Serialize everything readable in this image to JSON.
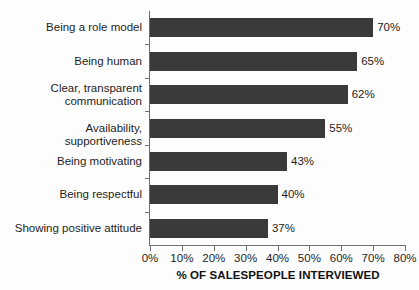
{
  "chart_data": {
    "type": "bar",
    "orientation": "horizontal",
    "title": "",
    "subtitle": "",
    "xlabel": "% OF SALESPEOPLE INTERVIEWED",
    "ylabel": "",
    "categories": [
      "Being a role model",
      "Being human",
      "Clear, transparent\ncommunication",
      "Availability, supportiveness",
      "Being motivating",
      "Being respectful",
      "Showing positive attitude"
    ],
    "values": [
      70,
      65,
      62,
      55,
      43,
      40,
      37
    ],
    "value_labels": [
      "70%",
      "65%",
      "62%",
      "55%",
      "43%",
      "40%",
      "37%"
    ],
    "xlim": [
      0,
      80
    ],
    "xticks": [
      0,
      10,
      20,
      30,
      40,
      50,
      60,
      70,
      80
    ],
    "xtick_labels": [
      "0%",
      "10%",
      "20%",
      "30%",
      "40%",
      "50%",
      "60%",
      "70%",
      "80%"
    ],
    "grid": false,
    "legend": false,
    "legend_position": "none",
    "bar_color": "#3a3a3a",
    "axis_color": "#6e6e6e",
    "text_color": "#1d1d1d",
    "background_color": "#fdfdfd"
  }
}
